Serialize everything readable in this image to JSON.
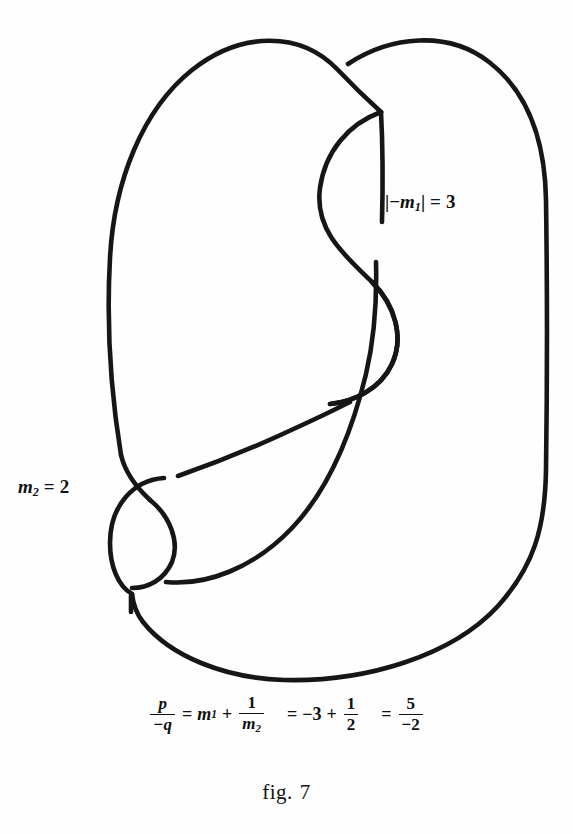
{
  "figure": {
    "caption_prefix": "fig.",
    "caption_number": "7",
    "stroke_color": "#161616",
    "background_color": "#fefefe",
    "width": 573,
    "height": 834,
    "type": "knot-diagram"
  },
  "annotations": {
    "m1_label": {
      "bar_open": "|",
      "minus": "−",
      "symbol": "m",
      "subscript": "1",
      "bar_close": "|",
      "equals": "=",
      "value": "3",
      "full_text": "|−m₁| = 3",
      "x": 385,
      "y": 192
    },
    "m2_label": {
      "symbol": "m",
      "subscript": "2",
      "equals": "=",
      "value": "2",
      "full_text": "m₂ = 2",
      "x": 18,
      "y": 477
    }
  },
  "formula": {
    "full_text": "p/-q = m₁ + 1/m₂ = -3 + 1/2 = 5/-2",
    "lhs": {
      "numerator": "p",
      "denominator": "−q"
    },
    "eq1": "=",
    "term_m1": {
      "symbol": "m",
      "subscript": "1"
    },
    "plus1": "+",
    "frac_inv_m2": {
      "numerator": "1",
      "denominator_symbol": "m",
      "denominator_subscript": "2"
    },
    "eq2": "=",
    "value_m1": "−3",
    "plus2": "+",
    "frac_half": {
      "numerator": "1",
      "denominator": "2"
    },
    "eq3": "=",
    "result": {
      "numerator": "5",
      "denominator": "−2"
    }
  },
  "knot_paths": {
    "outer_left_arc": "M 120 452 C 110 330 104 190 175 92 C 238 5 330 22 381 108",
    "right_outer_arc": "M 341 69 C 392 40 470 28 513 78 C 540 110 546 150 546 210 L 546 470 C 546 545 530 586 480 625 C 420 668 300 682 215 660 C 165 647 140 617 133 592",
    "upper_s_left": "M 381 108 C 342 128 318 160 318 200 C 318 250 362 268 385 300 C 404 326 406 362 386 388 C 370 409 345 415 325 412",
    "upper_vertical_over": "M 381 108 C 381 150 381 180 381 225",
    "lower_vertical_under": "M 374 263 C 374 300 370 345 358 380",
    "mid_descend": "M 358 380 C 348 430 330 490 290 530 C 250 570 200 586 160 580",
    "diagonal_strand": "M 178 474 C 230 455 290 428 345 405",
    "left_lower_curve": "M 120 452 C 126 472 140 486 152 500",
    "spiral_outer": "M 132 592 C 120 586 112 570 112 548 C 112 510 140 484 172 486",
    "spiral_inner": "M 152 500 C 170 514 176 540 166 558 C 158 572 146 578 136 578",
    "bottom_tail": "M 133 592 C 132 600 132 605 132 612"
  }
}
